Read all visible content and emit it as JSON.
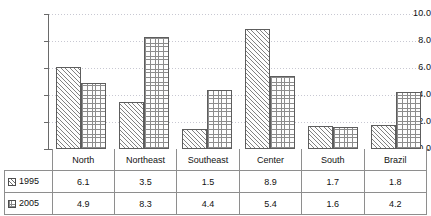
{
  "chart_data": {
    "type": "bar",
    "title": "",
    "xlabel": "",
    "ylabel": "",
    "categories": [
      "North",
      "Northeast",
      "Southeast",
      "Center",
      "South",
      "Brazil"
    ],
    "series": [
      {
        "name": "1995",
        "values": [
          6.1,
          3.5,
          1.5,
          8.9,
          1.7,
          1.8
        ],
        "pattern": "diagonal-hatch"
      },
      {
        "name": "2005",
        "values": [
          4.9,
          8.3,
          4.4,
          5.4,
          1.6,
          4.2
        ],
        "pattern": "cross-hatch"
      }
    ],
    "ylim": [
      0.0,
      10.0
    ],
    "ytick_labels": [
      "10.0",
      "8.0",
      "6.0",
      "4.0",
      "2.0",
      "0.0"
    ],
    "ytick_values": [
      10.0,
      8.0,
      6.0,
      4.0,
      2.0,
      0.0
    ],
    "grid": true,
    "grid_style": "dotted-horizontal",
    "legend_position": "table-left-column",
    "has_data_table": true,
    "colors": {
      "axis": "#6a6a6a",
      "grid": "#c8c8d2",
      "bar_outline": "#5d5d5d",
      "hatch": "#808080",
      "table_border": "#8e8e8e",
      "text": "#111111",
      "background": "#ffffff"
    }
  },
  "table": {
    "header_cells": [
      "North",
      "Northeast",
      "Southeast",
      "Center",
      "Brazil",
      "South"
    ],
    "rows": [
      {
        "label": "1995",
        "cells": [
          "6.1",
          "3.5",
          "1.5",
          "8.9",
          "1.7",
          "1.8"
        ]
      },
      {
        "label": "2005",
        "cells": [
          "4.9",
          "8.3",
          "4.4",
          "5.4",
          "1.6",
          "4.2"
        ]
      }
    ]
  }
}
